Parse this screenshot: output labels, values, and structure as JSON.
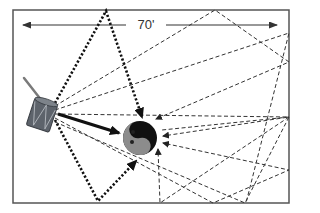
{
  "diagram": {
    "dimension_label": "70'",
    "room": {
      "x": 13,
      "y": 10,
      "width": 276,
      "height": 193,
      "stroke": "#555555"
    },
    "dimension_arrow": {
      "x1": 23,
      "x2": 277,
      "y": 25
    },
    "source": {
      "name": "drum",
      "color": "#5a5f66"
    },
    "listener": {
      "name": "head",
      "cx": 140,
      "cy": 138,
      "r": 17,
      "face_color": "#8a8a8a",
      "hair_color": "#111111"
    },
    "direct_path": {
      "from": [
        58,
        114
      ],
      "to": [
        121,
        133
      ],
      "style": "solid-thick"
    },
    "early_reflections": [
      {
        "points": [
          [
            55,
            103
          ],
          [
            106,
            10
          ],
          [
            143,
            119
          ]
        ],
        "style": "dotted-thick"
      },
      {
        "points": [
          [
            55,
            120
          ],
          [
            98,
            202
          ],
          [
            137,
            160
          ]
        ],
        "style": "dotted-thick"
      }
    ],
    "late_reflections": [
      {
        "points": [
          [
            55,
            106
          ],
          [
            215,
            10
          ],
          [
            289,
            62
          ],
          [
            155,
            119
          ]
        ],
        "style": "dashed"
      },
      {
        "points": [
          [
            55,
            110
          ],
          [
            289,
            33
          ],
          [
            246,
            203
          ],
          [
            162,
            130
          ]
        ],
        "style": "dashed"
      },
      {
        "points": [
          [
            55,
            114
          ],
          [
            289,
            117
          ],
          [
            160,
            203
          ],
          [
            159,
            148
          ]
        ],
        "style": "dashed"
      },
      {
        "points": [
          [
            55,
            118
          ],
          [
            213,
            203
          ],
          [
            289,
            170
          ],
          [
            163,
            143
          ]
        ],
        "style": "dashed"
      },
      {
        "points": [
          [
            55,
            122
          ],
          [
            245,
            203
          ],
          [
            289,
            117
          ],
          [
            162,
            137
          ]
        ],
        "style": "dashed"
      }
    ]
  }
}
